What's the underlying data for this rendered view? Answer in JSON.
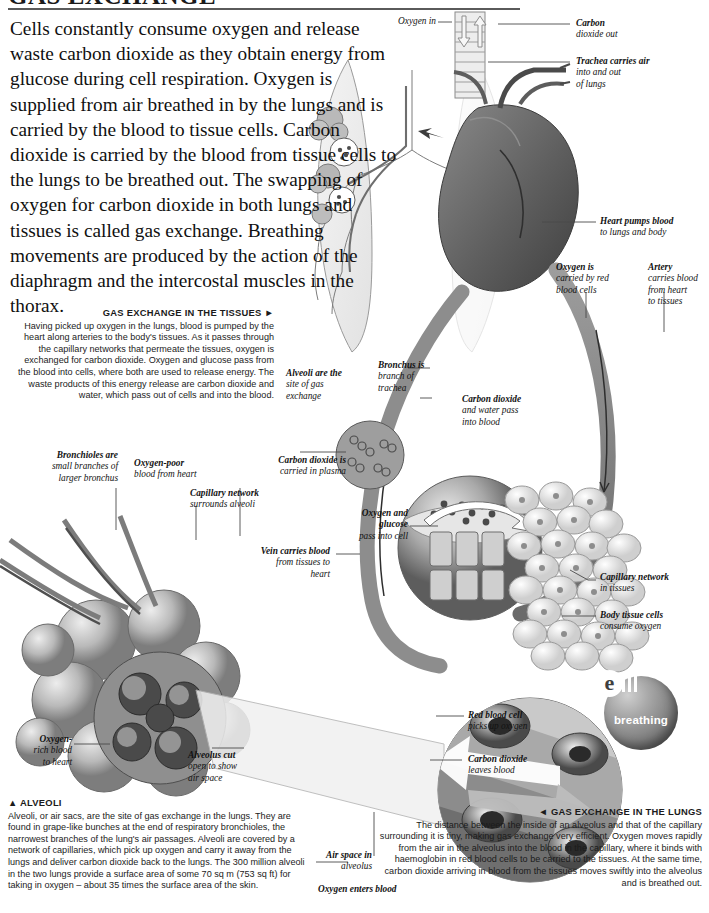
{
  "page": {
    "title": "GAS EXCHANGE"
  },
  "intro": {
    "text": "Cells constantly consume oxygen and release waste carbon dioxide as they obtain energy from glucose during cell respiration. Oxygen is supplied from air breathed in by the lungs and is carried by the blood to tissue cells. Carbon dioxide is carried by the blood from tissue cells to the lungs to be breathed out. The swapping of oxygen for carbon dioxide in both lungs and tissues is called gas exchange. Breathing movements are produced by the action of the diaphragm and the intercostal muscles in the thorax."
  },
  "captions": {
    "tissues": {
      "heading": "GAS EXCHANGE IN THE TISSUES ►",
      "body": "Having picked up oxygen in the lungs, blood is pumped by the heart along arteries to the body's tissues. As it passes through the capillary networks that permeate the tissues, oxygen is exchanged for carbon dioxide. Oxygen and glucose pass from the blood into cells, where both are used to release energy. The waste products of this energy release are carbon dioxide and water, which pass out of cells and into the blood."
    },
    "alveoli": {
      "heading": "▲ ALVEOLI",
      "body": "Alveoli, or air sacs, are the site of gas exchange in the lungs. They are found in grape-like bunches at the end of respiratory bronchioles, the narrowest branches of the lung's air passages. Alveoli are covered by a network of capillaries, which pick up oxygen and carry it away from the lungs and deliver carbon dioxide back to the lungs. The 300 million alveoli in the two lungs provide a surface area of some 70 sq m (753 sq ft) for taking in oxygen – about 35 times the surface area of the skin."
    },
    "lungs": {
      "heading": "◄ GAS EXCHANGE IN THE LUNGS",
      "body": "The distance between the inside of an alveolus and that of the capillary surrounding it is tiny, making gas exchange very efficient. Oxygen moves rapidly from the air in the alveolus into the blood in the capillary, where it binds with haemoglobin in red blood cells to be carried to the tissues. At the same time, carbon dioxide arriving in blood from the tissues moves swiftly into the alveolus and is breathed out."
    }
  },
  "labels": {
    "oxygen_in": "Oxygen in",
    "carbon_dioxide_out_1": "Carbon",
    "carbon_dioxide_out_2": "dioxide out",
    "trachea_1": "Trachea carries air",
    "trachea_2": "into and out",
    "trachea_3": "of lungs",
    "heart_1": "Heart pumps blood",
    "heart_2": "to lungs and body",
    "oxygen_rbc_1": "Oxygen is",
    "oxygen_rbc_2": "carried by red",
    "oxygen_rbc_3": "blood cells",
    "artery_1": "Artery",
    "artery_2": "carries blood",
    "artery_3": "from heart",
    "artery_4": "to tissues",
    "bronchus_1": "Bronchus is",
    "bronchus_2": "branch of",
    "bronchus_3": "trachea",
    "alveoli_site_1": "Alveoli are the",
    "alveoli_site_2": "site of gas",
    "alveoli_site_3": "exchange",
    "co2_water_1": "Carbon dioxide",
    "co2_water_2": "and water pass",
    "co2_water_3": "into blood",
    "bronchioles_1": "Bronchioles are",
    "bronchioles_2": "small branches of",
    "bronchioles_3": "larger bronchus",
    "oxygen_poor_1": "Oxygen-poor",
    "oxygen_poor_2": "blood from heart",
    "co2_plasma_1": "Carbon dioxide is",
    "co2_plasma_2": "carried in plasma",
    "capillary_alveoli_1": "Capillary network",
    "capillary_alveoli_2": "surrounds alveoli",
    "vein_1": "Vein carries blood",
    "vein_2": "from tissues to",
    "vein_3": "heart",
    "oxygen_glucose_1": "Oxygen and",
    "oxygen_glucose_2": "glucose",
    "oxygen_glucose_3": "pass into cell",
    "capillary_tissues_1": "Capillary network",
    "capillary_tissues_2": "in tissues",
    "body_tissue_1": "Body tissue cells",
    "body_tissue_2": "consume oxygen",
    "oxygen_rich_1": "Oxygen-",
    "oxygen_rich_2": "rich blood",
    "oxygen_rich_3": "to heart",
    "alveolus_cut_1": "Alveolus cut",
    "alveolus_cut_2": "open to show",
    "alveolus_cut_3": "air space",
    "rbc_pickup_1": "Red blood cell",
    "rbc_pickup_2": "picks up oxygen",
    "co2_leaves_1": "Carbon dioxide",
    "co2_leaves_2": "leaves blood",
    "air_space_1": "Air space in",
    "air_space_2": "alveolus",
    "oxygen_enters": "Oxygen enters blood"
  },
  "badge": {
    "logo": "e",
    "word": "breathing"
  },
  "colors": {
    "ink": "#111111",
    "rule": "#5a5a5a",
    "leader": "#4a4a4a",
    "vessel_dark": "#6e6e6e",
    "vessel_mid": "#9a9a9a",
    "tissue_light": "#d8d8d8"
  }
}
